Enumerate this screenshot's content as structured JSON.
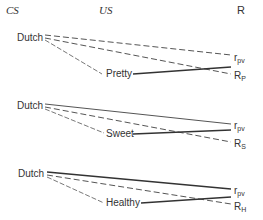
{
  "headers": {
    "cs": "CS",
    "us": "US",
    "r": "R"
  },
  "blocks": [
    {
      "cs": "Dutch",
      "us": "Pretty",
      "r_top": "r",
      "r_top_sub": "pv",
      "r_bot": "R",
      "r_bot_sub": "P",
      "links": {
        "cs_to_rtop": "dashed",
        "cs_to_rbot": "dashed",
        "cs_to_us": "dashed",
        "us_to_r": "solid"
      }
    },
    {
      "cs": "Dutch",
      "us": "Sweet",
      "r_top": "r",
      "r_top_sub": "pv",
      "r_bot": "R",
      "r_bot_sub": "S",
      "links": {
        "cs_to_rtop": "solid-thin",
        "cs_to_rbot": "dashed",
        "cs_to_us": "dashed",
        "us_to_r": "solid"
      }
    },
    {
      "cs": "Dutch",
      "us": "Healthy",
      "r_top": "r",
      "r_top_sub": "pv",
      "r_bot": "R",
      "r_bot_sub": "H",
      "links": {
        "cs_to_rtop": "solid-thick",
        "cs_to_rbot": "dashed",
        "cs_to_us": "dashed",
        "us_to_r": "solid"
      }
    }
  ]
}
